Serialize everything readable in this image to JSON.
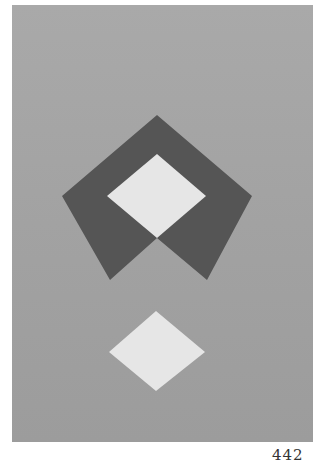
{
  "artwork": {
    "background_color": "#a3a3a3",
    "shapes": [
      {
        "name": "dark-pentagon-chevron",
        "color": "#555555"
      },
      {
        "name": "upper-light-diamond",
        "color": "#e6e6e6"
      },
      {
        "name": "lower-light-diamond",
        "color": "#e6e6e6"
      }
    ]
  },
  "page_number": "442"
}
